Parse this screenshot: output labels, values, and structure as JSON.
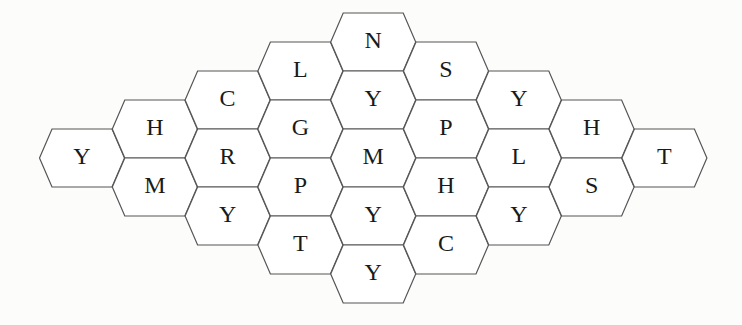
{
  "puzzle": {
    "type": "hexagonal letter grid",
    "colors": {
      "background": "#fcfcfb",
      "cell_fill": "#ffffff",
      "cell_stroke": "#555555",
      "letter": "#1a1a1a"
    },
    "geometry": {
      "hex_width": 85,
      "hex_height": 58,
      "column_step": 72.8,
      "row_step": 58,
      "origin_x": 82,
      "column_top_y": [
        158,
        129,
        100,
        71,
        42,
        71,
        100,
        129,
        158
      ]
    },
    "columns": [
      [
        "Y"
      ],
      [
        "H",
        "M"
      ],
      [
        "C",
        "R",
        "Y"
      ],
      [
        "L",
        "G",
        "P",
        "T"
      ],
      [
        "N",
        "Y",
        "M",
        "Y",
        "Y"
      ],
      [
        "S",
        "P",
        "H",
        "C"
      ],
      [
        "Y",
        "L",
        "Y"
      ],
      [
        "H",
        "S"
      ],
      [
        "T"
      ]
    ]
  }
}
